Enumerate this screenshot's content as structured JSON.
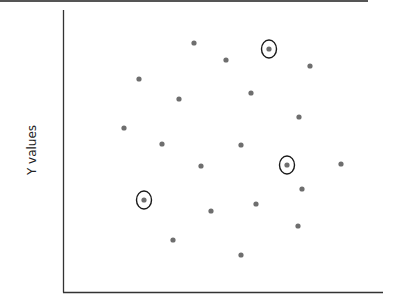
{
  "chart_data": {
    "type": "scatter",
    "title": "",
    "xlabel": "",
    "ylabel": "Y values",
    "grid": false,
    "legend": null,
    "axis_ticks": "none",
    "point_color": "#6e6e6e",
    "highlight_color": "#1a1a1a",
    "plot_area_px": {
      "x0": 63,
      "y0": 10,
      "x1": 383,
      "y1": 292
    },
    "points": [
      {
        "x": 194,
        "y": 43,
        "highlighted": false
      },
      {
        "x": 139,
        "y": 79,
        "highlighted": false
      },
      {
        "x": 179,
        "y": 99,
        "highlighted": false
      },
      {
        "x": 124,
        "y": 128,
        "highlighted": false
      },
      {
        "x": 162,
        "y": 144,
        "highlighted": false
      },
      {
        "x": 226,
        "y": 60,
        "highlighted": false
      },
      {
        "x": 269,
        "y": 49,
        "highlighted": true
      },
      {
        "x": 310,
        "y": 66,
        "highlighted": false
      },
      {
        "x": 251,
        "y": 93,
        "highlighted": false
      },
      {
        "x": 299,
        "y": 117,
        "highlighted": false
      },
      {
        "x": 241,
        "y": 145,
        "highlighted": false
      },
      {
        "x": 201,
        "y": 166,
        "highlighted": false
      },
      {
        "x": 287,
        "y": 165,
        "highlighted": true
      },
      {
        "x": 341,
        "y": 164,
        "highlighted": false
      },
      {
        "x": 302,
        "y": 189,
        "highlighted": false
      },
      {
        "x": 144,
        "y": 200,
        "highlighted": true
      },
      {
        "x": 256,
        "y": 204,
        "highlighted": false
      },
      {
        "x": 211,
        "y": 211,
        "highlighted": false
      },
      {
        "x": 298,
        "y": 226,
        "highlighted": false
      },
      {
        "x": 173,
        "y": 240,
        "highlighted": false
      },
      {
        "x": 241,
        "y": 255,
        "highlighted": false
      }
    ]
  },
  "axes": {
    "y_label": "Y values"
  }
}
